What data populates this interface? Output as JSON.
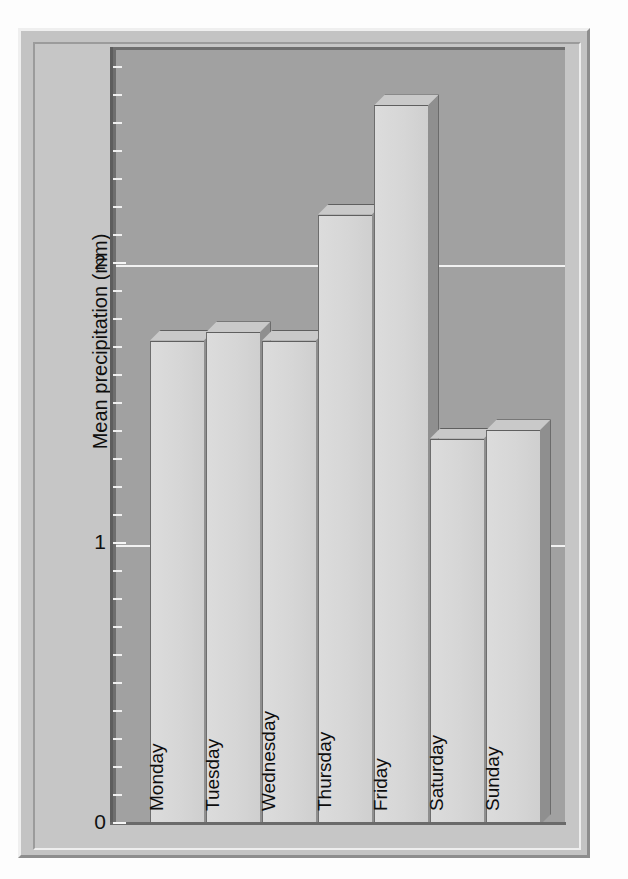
{
  "chart_data": {
    "type": "bar",
    "title": "",
    "xlabel": "",
    "ylabel": "Mean precipitation (mm)",
    "categories": [
      "Monday",
      "Tuesday",
      "Wednesday",
      "Thursday",
      "Friday",
      "Saturday",
      "Sunday"
    ],
    "values": [
      1.73,
      1.76,
      1.73,
      2.18,
      2.57,
      1.38,
      1.41
    ],
    "ylim": [
      0,
      2.77
    ],
    "ytick_labels": [
      "0",
      "1",
      "2"
    ],
    "ytick_values": [
      0,
      1,
      2
    ],
    "yminor_step": 0.1,
    "grid": true,
    "gridline_values": [
      1,
      2
    ],
    "legend": "none",
    "style": "3d-bar",
    "colors": {
      "bar_face": "#d6d6d6",
      "bar_side": "#8f8f8f",
      "bar_top": "#c9c9c9",
      "plot_background": "#a1a1a1",
      "figure_background": "#c6c6c6",
      "gridline": "#f2f2f2",
      "axis": "#5d5d5d",
      "text": "#0d0d0d"
    }
  },
  "figure": {
    "y_axis_title": "Mean precipitation (mm)",
    "tick_0": "0",
    "tick_1": "1",
    "tick_2": "2"
  }
}
